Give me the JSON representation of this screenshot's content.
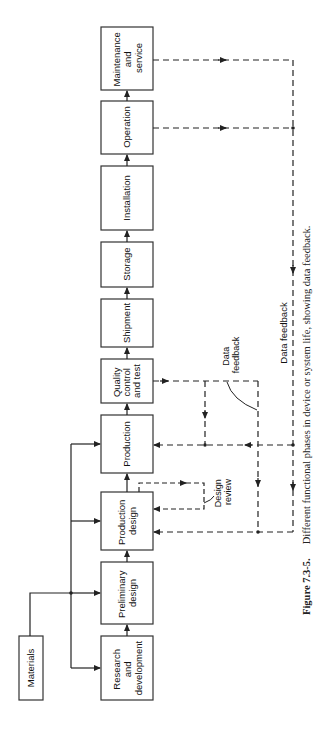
{
  "diagram": {
    "phases": [
      {
        "id": "research",
        "lines": [
          "Research",
          "and",
          "development"
        ]
      },
      {
        "id": "preliminary",
        "lines": [
          "Preliminary",
          "design"
        ]
      },
      {
        "id": "production-design",
        "lines": [
          "Production",
          "design"
        ]
      },
      {
        "id": "production",
        "lines": [
          "Production"
        ]
      },
      {
        "id": "quality",
        "lines": [
          "Quality",
          "control",
          "and test"
        ]
      },
      {
        "id": "shipment",
        "lines": [
          "Shipment"
        ]
      },
      {
        "id": "storage",
        "lines": [
          "Storage"
        ]
      },
      {
        "id": "installation",
        "lines": [
          "Installation"
        ]
      },
      {
        "id": "operation",
        "lines": [
          "Operation"
        ]
      },
      {
        "id": "maintenance",
        "lines": [
          "Maintenance",
          "and",
          "service"
        ]
      }
    ],
    "materials": "Materials",
    "labels": {
      "design_review_1": "Design",
      "design_review_2": "review",
      "qc_feedback_1": "Data",
      "qc_feedback_2": "feedback",
      "main_feedback": "Data feedback"
    },
    "colors": {
      "line": "#222222",
      "box_border": "#333333",
      "background": "#ffffff"
    }
  },
  "caption": {
    "figure_number": "Figure 7.3-5.",
    "text": "Different functional phases in device or system life, showing data feedback."
  }
}
